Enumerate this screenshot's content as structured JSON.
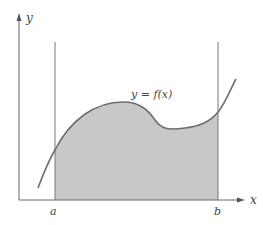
{
  "diagram": {
    "type": "area-under-curve",
    "curve_label": "y = f(x)",
    "axes": {
      "x_label": "x",
      "y_label": "y"
    },
    "bounds": {
      "lower_label": "a",
      "upper_label": "b"
    },
    "colors": {
      "axis": "#666666",
      "curve": "#6e6e6e",
      "fill": "#c8c8c8",
      "bound_lines": "#777777"
    }
  }
}
